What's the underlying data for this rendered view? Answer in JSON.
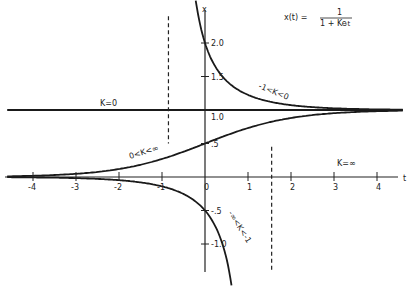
{
  "chart_data": {
    "type": "line",
    "title": "",
    "formula": "x(t) = 1 / (1 + K e^-t)",
    "xlabel": "t",
    "ylabel": "x",
    "xlim": [
      -4.6,
      4.6
    ],
    "ylim": [
      -1.4,
      2.6
    ],
    "grid": false,
    "x_ticks": [
      {
        "value": -4,
        "label": "-4"
      },
      {
        "value": -3,
        "label": "-3"
      },
      {
        "value": -2,
        "label": "-2"
      },
      {
        "value": -1,
        "label": "-1"
      },
      {
        "value": 0,
        "label": "0"
      },
      {
        "value": 1,
        "label": "1"
      },
      {
        "value": 2,
        "label": "2"
      },
      {
        "value": 3,
        "label": "3"
      },
      {
        "value": 4,
        "label": "4"
      }
    ],
    "y_ticks": [
      {
        "value": 2.0,
        "label": "2.0"
      },
      {
        "value": 1.5,
        "label": "1.5"
      },
      {
        "value": 1.0,
        "label": "1.0"
      },
      {
        "value": 0.5,
        "label": ".5"
      },
      {
        "value": -0.5,
        "label": "-.5"
      },
      {
        "value": -1.0,
        "label": "-1.0"
      }
    ],
    "series": [
      {
        "name": "K=0",
        "K": 0,
        "label": "K=0",
        "t_range": [
          -4.6,
          4.6
        ]
      },
      {
        "name": "-1<K<0",
        "K": -0.5,
        "label": "-1<K<0",
        "t_range": [
          -0.55,
          4.6
        ]
      },
      {
        "name": "0<K<inf",
        "K": 1,
        "label": "0<K<∞",
        "t_range": [
          -4.6,
          4.6
        ]
      },
      {
        "name": "-inf<K<-1",
        "K": -3,
        "label": "-∞<K<-1",
        "t_range": [
          -4.6,
          0.95
        ]
      },
      {
        "name": "K=inf",
        "label": "K=∞"
      }
    ],
    "asymptotes": [
      {
        "t": -0.85,
        "x_range": [
          0.5,
          2.4
        ]
      },
      {
        "t": 1.55,
        "x_range": [
          -1.4,
          0.45
        ]
      }
    ]
  },
  "labels": {
    "formula_lhs": "x(t) =",
    "formula_num": "1",
    "formula_den": "1 + Ke",
    "formula_exp": "-t",
    "x_axis_name": "t",
    "y_axis_name": "x",
    "k0": "K=0",
    "k_neg_small": "-1<K<0",
    "k_pos": "0<K<∞",
    "k_neg_large": "-∞<K<-1",
    "k_inf": "K=∞"
  }
}
